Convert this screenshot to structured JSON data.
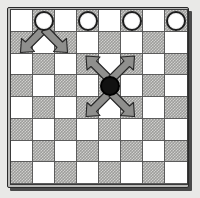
{
  "diagram": {
    "board": {
      "rows": 8,
      "columns": 8,
      "light_square_color": "#ffffff",
      "dark_square_color": "#9d9d9b",
      "dark_square_pattern": "dither-checker",
      "grid_line_color": "#5c5c5c",
      "frame_color": "#b9b9b7",
      "frame_border_color": "#2a2a2a",
      "shadow_color": "#4a4a4a",
      "background_color": "#e9e9e7",
      "pattern": [
        [
          "light",
          "dark",
          "light",
          "dark",
          "light",
          "dark",
          "light",
          "dark"
        ],
        [
          "dark",
          "light",
          "dark",
          "light",
          "dark",
          "light",
          "dark",
          "light"
        ],
        [
          "light",
          "dark",
          "light",
          "dark",
          "light",
          "dark",
          "light",
          "dark"
        ],
        [
          "dark",
          "light",
          "dark",
          "light",
          "dark",
          "light",
          "dark",
          "light"
        ],
        [
          "light",
          "dark",
          "light",
          "dark",
          "light",
          "dark",
          "light",
          "dark"
        ],
        [
          "dark",
          "light",
          "dark",
          "light",
          "dark",
          "light",
          "dark",
          "light"
        ],
        [
          "light",
          "dark",
          "light",
          "dark",
          "light",
          "dark",
          "light",
          "dark"
        ],
        [
          "dark",
          "light",
          "dark",
          "light",
          "dark",
          "light",
          "dark",
          "light"
        ]
      ]
    },
    "pieces": [
      {
        "id": "white-piece-1",
        "color": "white",
        "row": 0,
        "col": 1,
        "fill": "#ffffff",
        "outline": "#1d1d1d"
      },
      {
        "id": "white-piece-2",
        "color": "white",
        "row": 0,
        "col": 3,
        "fill": "#ffffff",
        "outline": "#1d1d1d"
      },
      {
        "id": "white-piece-3",
        "color": "white",
        "row": 0,
        "col": 5,
        "fill": "#ffffff",
        "outline": "#1d1d1d"
      },
      {
        "id": "white-piece-4",
        "color": "white",
        "row": 0,
        "col": 7,
        "fill": "#ffffff",
        "outline": "#1d1d1d"
      },
      {
        "id": "black-piece-1",
        "color": "black",
        "row": 3,
        "col": 4,
        "fill": "#111111",
        "outline": "#000000"
      }
    ],
    "arrows": {
      "fill": "#8f8f8d",
      "outline": "#262626",
      "groups": [
        {
          "id": "white-piece-moves",
          "origin_row": 0,
          "origin_col": 1,
          "directions": [
            "down-left",
            "down-right"
          ],
          "count": 2
        },
        {
          "id": "black-piece-moves",
          "origin_row": 3,
          "origin_col": 4,
          "directions": [
            "up-left",
            "up-right",
            "down-left",
            "down-right"
          ],
          "count": 4
        }
      ]
    }
  }
}
